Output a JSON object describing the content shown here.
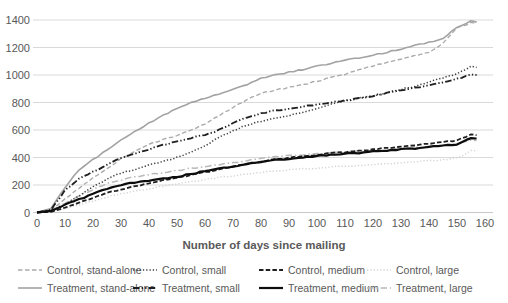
{
  "chart_data": {
    "type": "line",
    "title": "",
    "xlabel": "Number of days since mailing",
    "ylabel": "",
    "grid": "horizontal",
    "legend_position": "bottom",
    "xlim": [
      0,
      163
    ],
    "ylim": [
      0,
      1400
    ],
    "x_ticks": [
      0,
      10,
      20,
      30,
      40,
      50,
      60,
      70,
      80,
      90,
      100,
      110,
      120,
      130,
      140,
      150,
      160
    ],
    "y_ticks": [
      0,
      200,
      400,
      600,
      800,
      1000,
      1200,
      1400
    ],
    "x_days": [
      0,
      5,
      10,
      15,
      20,
      25,
      30,
      35,
      40,
      45,
      50,
      55,
      60,
      65,
      70,
      75,
      80,
      85,
      90,
      95,
      100,
      105,
      110,
      115,
      120,
      125,
      130,
      135,
      140,
      145,
      150,
      155,
      157
    ],
    "series": [
      {
        "key": "control-stand-alone",
        "name": "Control, stand-alone",
        "color": "#ababab",
        "dash": "4.5 2.5",
        "width": 1.4,
        "values": [
          0,
          15,
          95,
          175,
          250,
          320,
          390,
          445,
          495,
          530,
          560,
          595,
          645,
          705,
          765,
          820,
          865,
          890,
          910,
          930,
          955,
          980,
          1005,
          1040,
          1065,
          1090,
          1115,
          1140,
          1165,
          1230,
          1340,
          1380,
          1372
        ]
      },
      {
        "key": "control-small",
        "name": "Control, small",
        "color": "#3f3f3f",
        "dash": "1.3 2",
        "width": 1.5,
        "values": [
          0,
          10,
          60,
          120,
          185,
          245,
          285,
          315,
          345,
          370,
          400,
          435,
          485,
          545,
          595,
          635,
          665,
          685,
          705,
          725,
          755,
          785,
          810,
          830,
          850,
          870,
          895,
          920,
          950,
          980,
          1010,
          1060,
          1055
        ]
      },
      {
        "key": "control-medium",
        "name": "Control, medium",
        "color": "#1f1f1f",
        "dash": "4.5 2.2",
        "width": 1.8,
        "values": [
          0,
          5,
          35,
          70,
          105,
          140,
          170,
          190,
          212,
          232,
          252,
          272,
          292,
          312,
          332,
          352,
          372,
          385,
          397,
          408,
          420,
          430,
          440,
          450,
          460,
          470,
          480,
          490,
          500,
          512,
          525,
          565,
          562
        ]
      },
      {
        "key": "control-large",
        "name": "Control, large",
        "color": "#d4d4d4",
        "dash": "1.3 2",
        "width": 1.4,
        "values": [
          0,
          5,
          28,
          55,
          85,
          112,
          136,
          155,
          172,
          190,
          208,
          224,
          240,
          255,
          268,
          280,
          292,
          300,
          308,
          316,
          324,
          330,
          336,
          342,
          348,
          354,
          360,
          368,
          376,
          385,
          395,
          450,
          448
        ]
      },
      {
        "key": "treatment-stand-alone",
        "name": "Treatment, stand-alone",
        "color": "#a3a3a3",
        "dash": "",
        "width": 1.6,
        "values": [
          0,
          30,
          180,
          310,
          385,
          455,
          530,
          590,
          650,
          705,
          760,
          800,
          830,
          860,
          895,
          930,
          975,
          1000,
          1020,
          1040,
          1065,
          1085,
          1105,
          1125,
          1145,
          1165,
          1190,
          1215,
          1240,
          1265,
          1345,
          1395,
          1385
        ]
      },
      {
        "key": "treatment-small",
        "name": "Treatment, small",
        "color": "#1f1f1f",
        "dash": "6.5 2.2 1.3 2.2 1.3 2.2",
        "width": 1.8,
        "values": [
          0,
          20,
          160,
          245,
          295,
          345,
          395,
          430,
          460,
          490,
          515,
          540,
          565,
          600,
          650,
          690,
          720,
          740,
          755,
          770,
          785,
          800,
          815,
          830,
          848,
          868,
          888,
          908,
          928,
          950,
          970,
          1005,
          1000
        ]
      },
      {
        "key": "treatment-medium",
        "name": "Treatment, medium",
        "color": "#0d0d0d",
        "dash": "",
        "width": 2.2,
        "values": [
          0,
          12,
          55,
          95,
          135,
          175,
          200,
          218,
          232,
          246,
          260,
          280,
          300,
          318,
          336,
          354,
          370,
          381,
          391,
          400,
          410,
          419,
          427,
          435,
          443,
          451,
          459,
          467,
          476,
          486,
          498,
          540,
          538
        ]
      },
      {
        "key": "treatment-large",
        "name": "Treatment, large",
        "color": "#b9b9b9",
        "dash": "6.5 2.8 1.5 2.8",
        "width": 1.5,
        "values": [
          0,
          15,
          70,
          120,
          168,
          210,
          238,
          258,
          276,
          292,
          306,
          320,
          334,
          348,
          362,
          378,
          394,
          404,
          412,
          420,
          428,
          434,
          440,
          446,
          452,
          458,
          464,
          472,
          480,
          490,
          500,
          525,
          523
        ]
      }
    ],
    "draw_order": [
      3,
      7,
      0,
      4,
      1,
      5,
      2,
      6
    ],
    "legend": {
      "columns_x": [
        18,
        133,
        259,
        367
      ],
      "rows_y": [
        264,
        282
      ]
    },
    "colors": {
      "gridline": "#d9d9d9",
      "axis_line": "#c9c9c9",
      "tick_text": "#595959"
    }
  }
}
